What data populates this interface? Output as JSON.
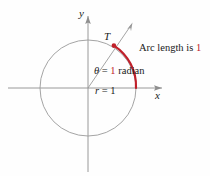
{
  "figure": {
    "background_color": "#fefefe",
    "geometry_color": "#8e8e8e",
    "accent_color": "#c0202a",
    "text_color": "#1a1a1a",
    "circle": {
      "center_x": 88,
      "center_y": 88,
      "radius": 48,
      "radius_value": "1"
    },
    "angle_radians": 1,
    "arc_length": "1"
  },
  "axes": {
    "y_label": "y",
    "x_label": "x",
    "x_axis": {
      "from_x": 8,
      "to_x": 166,
      "y": 88
    },
    "y_axis": {
      "x": 88,
      "from_y": 12,
      "to_y": 172
    }
  },
  "point": {
    "label": "T",
    "x": 114,
    "y": 47
  },
  "annotations": {
    "arc_length": {
      "prefix": "Arc length is ",
      "value": "1"
    },
    "angle": {
      "symbol": "θ",
      "equals": " = ",
      "value": "1",
      "unit": " radian"
    },
    "radius": {
      "symbol": "r",
      "equals": " = ",
      "value": "1"
    }
  }
}
